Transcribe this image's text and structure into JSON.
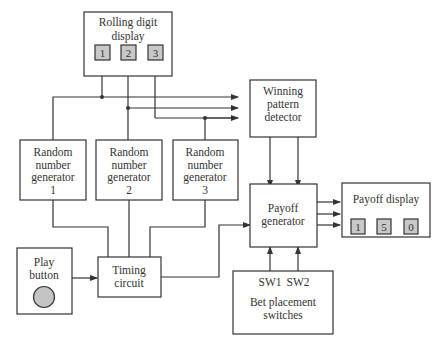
{
  "diagram": {
    "blocks": {
      "rolling_display": {
        "lines": [
          "Rolling digit",
          "display"
        ],
        "digits": [
          "1",
          "2",
          "3"
        ]
      },
      "rng1": {
        "lines": [
          "Random",
          "number",
          "generator",
          "1"
        ]
      },
      "rng2": {
        "lines": [
          "Random",
          "number",
          "generator",
          "2"
        ]
      },
      "rng3": {
        "lines": [
          "Random",
          "number",
          "generator",
          "3"
        ]
      },
      "winning_detector": {
        "lines": [
          "Winning",
          "pattern",
          "detector"
        ]
      },
      "payoff_generator": {
        "lines": [
          "Payoff",
          "generator"
        ]
      },
      "payoff_display": {
        "lines": [
          "Payoff display"
        ],
        "digits": [
          "1",
          "5",
          "0"
        ]
      },
      "play_button": {
        "lines": [
          "Play",
          "button"
        ]
      },
      "timing_circuit": {
        "lines": [
          "Timing",
          "circuit"
        ]
      },
      "bet_switches": {
        "sw": [
          "SW1",
          "SW2"
        ],
        "lines": [
          "Bet placement",
          "switches"
        ]
      }
    },
    "connections": [
      {
        "from": "play_button",
        "to": "timing_circuit"
      },
      {
        "from": "timing_circuit",
        "to": "rng1"
      },
      {
        "from": "timing_circuit",
        "to": "rng2"
      },
      {
        "from": "timing_circuit",
        "to": "rng3"
      },
      {
        "from": "timing_circuit",
        "to": "payoff_generator"
      },
      {
        "from": "rng1",
        "to": "rolling_display"
      },
      {
        "from": "rng2",
        "to": "rolling_display"
      },
      {
        "from": "rng3",
        "to": "rolling_display"
      },
      {
        "from": "rng1",
        "to": "winning_detector"
      },
      {
        "from": "rng2",
        "to": "winning_detector"
      },
      {
        "from": "rng3",
        "to": "winning_detector"
      },
      {
        "from": "winning_detector",
        "to": "payoff_generator"
      },
      {
        "from": "payoff_generator",
        "to": "payoff_display"
      },
      {
        "from": "bet_switches",
        "to": "payoff_generator"
      }
    ]
  }
}
